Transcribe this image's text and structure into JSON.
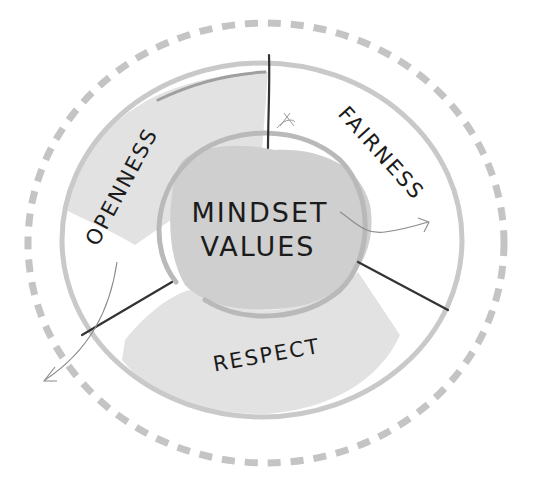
{
  "diagram": {
    "center": {
      "line1": "MINDSET",
      "line2": "VALUES"
    },
    "segments": [
      {
        "id": "openness",
        "label": "OPENNESS"
      },
      {
        "id": "fairness",
        "label": "FAIRNESS"
      },
      {
        "id": "respect",
        "label": "RESPECT"
      }
    ],
    "colors": {
      "dashed_ring": "#c4c4c4",
      "outer_ring": "#c9c9c9",
      "segment_fill": "#e2e2e2",
      "center_blob": "#cfcfcf",
      "inner_ring": "#b9b9b9",
      "divider_line": "#333333",
      "arrow_line": "#8a8a8a",
      "text": "#1b1b1b"
    }
  }
}
